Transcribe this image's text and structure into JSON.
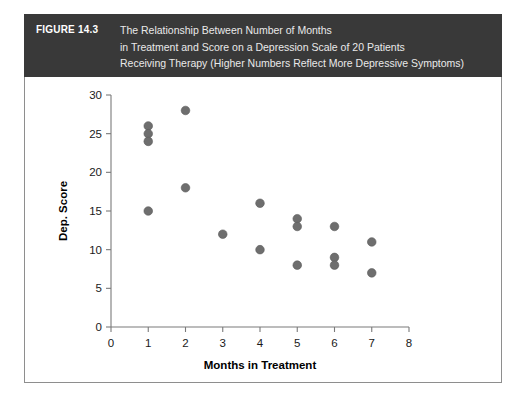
{
  "figure": {
    "number_label": "FIGURE 14.3",
    "caption_lines": [
      "The Relationship Between Number of Months",
      "in Treatment and Score on a Depression Scale of 20 Patients",
      "Receiving Therapy (Higher Numbers Reflect More Depressive Symptoms)"
    ],
    "header_bg": "#393939",
    "header_text_color": "#e9e9e9"
  },
  "chart_data": {
    "type": "scatter",
    "title": "",
    "xlabel": "Months in Treatment",
    "ylabel": "Dep. Score",
    "xlim": [
      0,
      8
    ],
    "ylim": [
      0,
      30
    ],
    "xticks": [
      0,
      1,
      2,
      3,
      4,
      5,
      6,
      7,
      8
    ],
    "yticks": [
      0,
      5,
      10,
      15,
      20,
      25,
      30
    ],
    "xtick_labels": [
      "0",
      "1",
      "2",
      "3",
      "4",
      "5",
      "6",
      "7",
      "8"
    ],
    "ytick_labels": [
      "0",
      "5",
      "10",
      "15",
      "20",
      "25",
      "30"
    ],
    "grid": false,
    "legend": null,
    "marker_color": "#6e6e6e",
    "n_points": 20,
    "points": [
      {
        "x": 1,
        "y": 26
      },
      {
        "x": 1,
        "y": 25
      },
      {
        "x": 1,
        "y": 24
      },
      {
        "x": 1,
        "y": 15
      },
      {
        "x": 2,
        "y": 28
      },
      {
        "x": 2,
        "y": 18
      },
      {
        "x": 3,
        "y": 12
      },
      {
        "x": 4,
        "y": 16
      },
      {
        "x": 4,
        "y": 10
      },
      {
        "x": 5,
        "y": 14
      },
      {
        "x": 5,
        "y": 13
      },
      {
        "x": 5,
        "y": 8
      },
      {
        "x": 6,
        "y": 13
      },
      {
        "x": 6,
        "y": 9
      },
      {
        "x": 6,
        "y": 8
      },
      {
        "x": 7,
        "y": 11
      },
      {
        "x": 7,
        "y": 7
      }
    ]
  }
}
